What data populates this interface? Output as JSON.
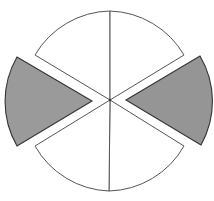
{
  "diagram": {
    "sector_count": 6,
    "shaded_sector_count": 2,
    "colors": {
      "background": "#ffffff",
      "white_sector_fill": "#ffffff",
      "shaded_sector_fill": "#9a9a9a",
      "outline": "#555555",
      "shaded_outline": "#333333"
    },
    "sectors": [
      {
        "id": "top-left",
        "shaded": false,
        "exploded": false
      },
      {
        "id": "top-right",
        "shaded": false,
        "exploded": false
      },
      {
        "id": "right",
        "shaded": true,
        "exploded": true
      },
      {
        "id": "bottom-right",
        "shaded": false,
        "exploded": false
      },
      {
        "id": "bottom-left",
        "shaded": false,
        "exploded": false
      },
      {
        "id": "left",
        "shaded": true,
        "exploded": true
      }
    ]
  }
}
